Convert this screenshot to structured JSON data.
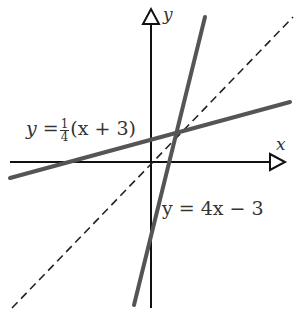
{
  "diagram": {
    "type": "coordinate-plane-lines",
    "axes": {
      "x_label": "x",
      "y_label": "y"
    },
    "lines": [
      {
        "id": "line1",
        "equation_prefix": "y =",
        "frac_num": "1",
        "frac_den": "4",
        "equation_suffix": "(x + 3)",
        "style": "solid-thick",
        "color": "#555555"
      },
      {
        "id": "line2",
        "equation": "y = 4x − 3",
        "style": "solid-thick",
        "color": "#555555"
      },
      {
        "id": "mirror",
        "equation": "y = x",
        "style": "dashed",
        "color": "#222222",
        "labeled": false
      }
    ],
    "intersection": "(1, 1)"
  }
}
